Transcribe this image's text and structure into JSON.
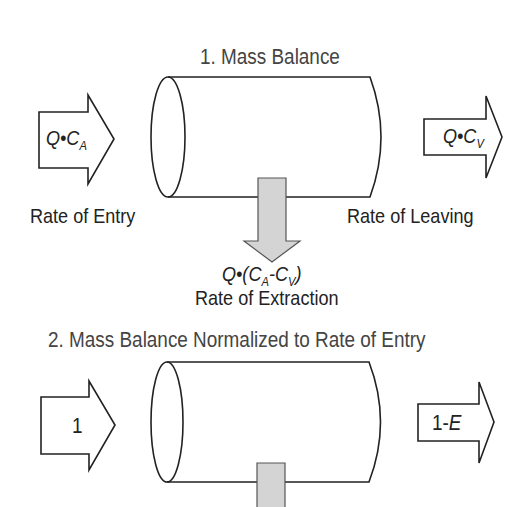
{
  "diagram": {
    "section1": {
      "title": "1. Mass Balance",
      "entry_formula": {
        "base": "Q•C",
        "sub": "A"
      },
      "entry_label": "Rate of Entry",
      "leaving_formula": {
        "base": "Q•C",
        "sub": "V"
      },
      "leaving_label": "Rate of Leaving",
      "extraction_formula": {
        "prefix": "Q•(C",
        "sub1": "A",
        "mid": "-C",
        "sub2": "V",
        "suffix": ")"
      },
      "extraction_label": "Rate of Extraction"
    },
    "section2": {
      "title": "2. Mass Balance Normalized to Rate of Entry",
      "entry_value": "1",
      "leaving_value": {
        "prefix": "1-",
        "var": "E"
      }
    },
    "colors": {
      "stroke": "#222222",
      "extraction_fill": "#d4d4d4",
      "background": "#ffffff"
    }
  }
}
